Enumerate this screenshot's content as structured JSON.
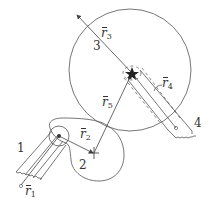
{
  "diagram": {
    "type": "mechanism-vector-loop",
    "colors": {
      "line": "#555555",
      "text": "#333333",
      "background": "#ffffff"
    },
    "links": [
      {
        "id": "1",
        "label": "1",
        "description": "slotted ground link with wavy fixed end"
      },
      {
        "id": "2",
        "label": "2",
        "description": "cam/lobe body pinned at link 1 pivot"
      },
      {
        "id": "3",
        "label": "3",
        "description": "large circular disk"
      },
      {
        "id": "4",
        "label": "4",
        "description": "slotted link with wavy fixed end"
      }
    ],
    "vectors": [
      {
        "id": "r1",
        "name": "r",
        "sub": "1"
      },
      {
        "id": "r2",
        "name": "r",
        "sub": "2"
      },
      {
        "id": "r3",
        "name": "r",
        "sub": "3"
      },
      {
        "id": "r4",
        "name": "r",
        "sub": "4"
      },
      {
        "id": "r5",
        "name": "r",
        "sub": "5"
      }
    ]
  },
  "labels": {
    "link1": "1",
    "link2": "2",
    "link3": "3",
    "link4": "4",
    "r1": {
      "name": "r",
      "sub": "1"
    },
    "r2": {
      "name": "r",
      "sub": "2"
    },
    "r3": {
      "name": "r",
      "sub": "3"
    },
    "r4": {
      "name": "r",
      "sub": "4"
    },
    "r5": {
      "name": "r",
      "sub": "5"
    }
  }
}
